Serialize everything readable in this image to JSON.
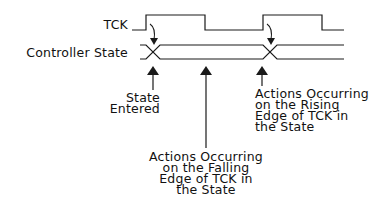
{
  "signals": {
    "tck": {
      "label": "TCK"
    },
    "controller_state": {
      "label": "Controller State"
    }
  },
  "annotations": {
    "state_entered": {
      "lines": [
        "State",
        "Entered"
      ]
    },
    "falling_edge": {
      "lines": [
        "Actions Occurring",
        "on the Falling",
        "Edge of TCK in",
        "the State"
      ]
    },
    "rising_edge": {
      "lines": [
        "Actions Occurring",
        "on the Rising",
        "Edge of TCK in",
        "the State"
      ]
    }
  },
  "colors": {
    "line": "#1a1a1a",
    "background": "#ffffff"
  }
}
